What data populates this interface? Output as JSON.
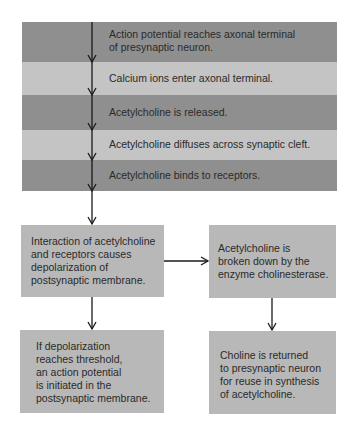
{
  "diagram": {
    "sequence_rows": [
      {
        "lines": [
          "Action potential reaches axonal terminal",
          "of presynaptic neuron."
        ],
        "shade": "dark"
      },
      {
        "lines": [
          "Calcium ions enter axonal terminal."
        ],
        "shade": "light"
      },
      {
        "lines": [
          "Acetylcholine is released."
        ],
        "shade": "dark"
      },
      {
        "lines": [
          "Acetylcholine diffuses across synaptic cleft."
        ],
        "shade": "light"
      },
      {
        "lines": [
          "Acetylcholine binds to receptors."
        ],
        "shade": "dark"
      }
    ],
    "boxes": {
      "interaction": {
        "lines": [
          "Interaction of acetylcholine",
          "and receptors causes",
          "depolarization of",
          "postsynaptic membrane."
        ]
      },
      "breakdown": {
        "lines": [
          "Acetylcholine is",
          "broken down by the",
          "enzyme cholinesterase."
        ]
      },
      "threshold": {
        "lines": [
          "If depolarization",
          "reaches threshold,",
          "an action potential",
          "is initiated in the",
          "postsynaptic membrane."
        ]
      },
      "recycle": {
        "lines": [
          "Choline is returned",
          "to presynaptic neuron",
          "for reuse in synthesis",
          "of acetylcholine."
        ]
      }
    },
    "colors": {
      "dark_row": "#8f8f8f",
      "light_row": "#c4c4c4",
      "box": "#b8b8b8",
      "arrow": "#1a1a1a"
    }
  }
}
